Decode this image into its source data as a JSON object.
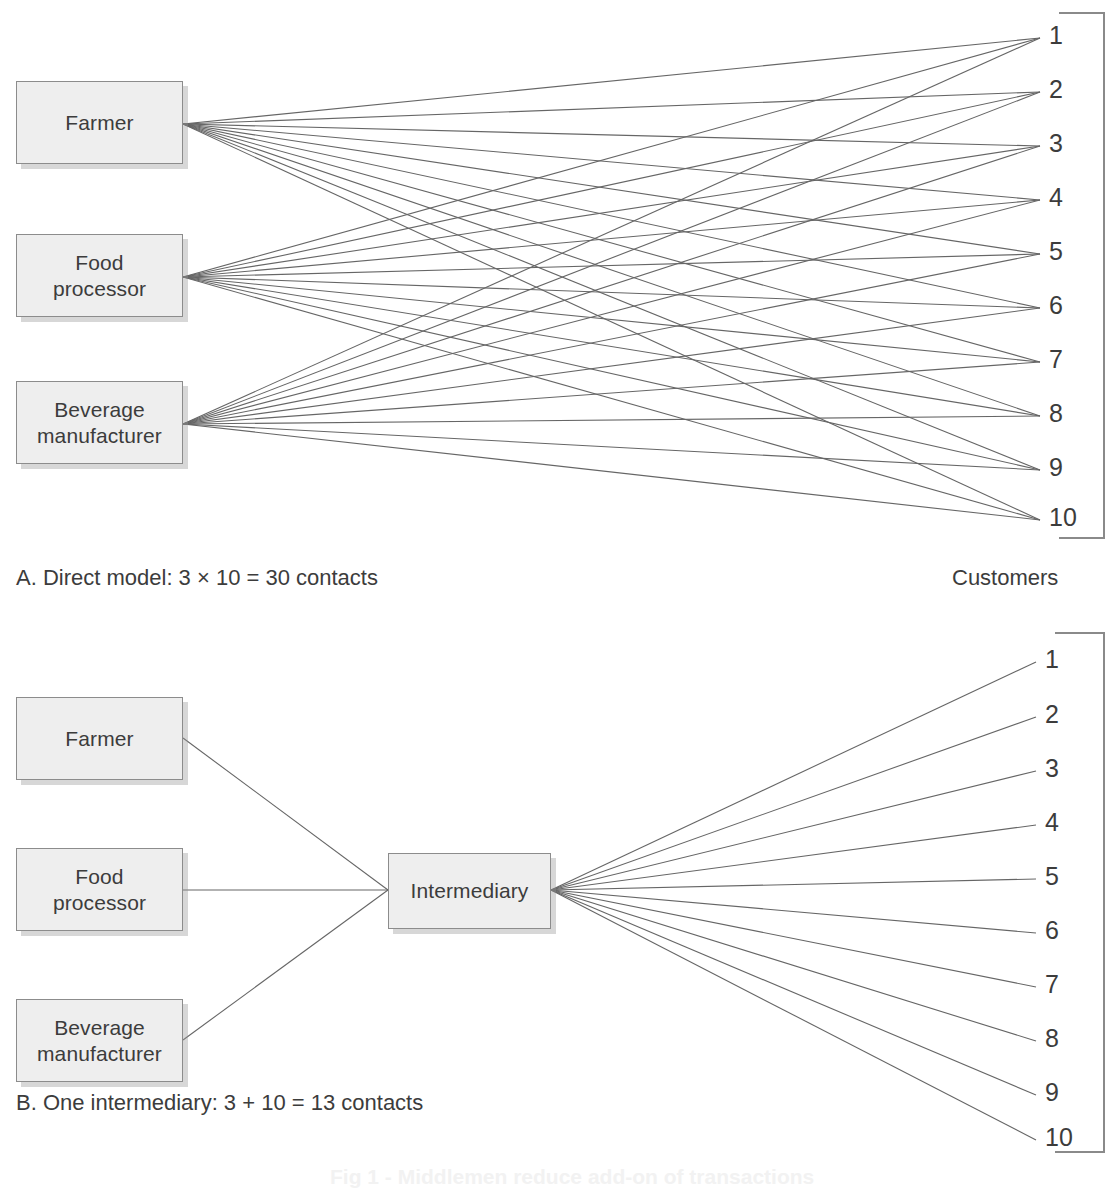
{
  "figure": {
    "title_partial": "Fig 1 - Middlemen reduce add-on of transactions"
  },
  "panel_a": {
    "caption": "A. Direct model: 3 × 10 = 30 contacts",
    "customers_label": "Customers",
    "producers": [
      {
        "id": "farmer",
        "lines": [
          "Farmer"
        ]
      },
      {
        "id": "food-processor",
        "lines": [
          "Food",
          "processor"
        ]
      },
      {
        "id": "beverage-manufacturer",
        "lines": [
          "Beverage",
          "manufacturer"
        ]
      }
    ],
    "customers": [
      "1",
      "2",
      "3",
      "4",
      "5",
      "6",
      "7",
      "8",
      "9",
      "10"
    ],
    "contacts_count": 30,
    "producer_count": 3,
    "customer_count": 10
  },
  "panel_b": {
    "caption": "B. One intermediary: 3 + 10 = 13 contacts",
    "producers": [
      {
        "id": "farmer",
        "lines": [
          "Farmer"
        ]
      },
      {
        "id": "food-processor",
        "lines": [
          "Food",
          "processor"
        ]
      },
      {
        "id": "beverage-manufacturer",
        "lines": [
          "Beverage",
          "manufacturer"
        ]
      }
    ],
    "intermediary": {
      "id": "intermediary",
      "lines": [
        "Intermediary"
      ]
    },
    "customers": [
      "1",
      "2",
      "3",
      "4",
      "5",
      "6",
      "7",
      "8",
      "9",
      "10"
    ],
    "contacts_count": 13,
    "producer_count": 3,
    "customer_count": 10
  },
  "colors": {
    "box_fill": "#eeeeee",
    "box_border": "#8c8c8c",
    "line": "#666666",
    "text": "#3c3c3c",
    "bracket": "#8a8a8a",
    "background": "#ffffff"
  },
  "geometry": {
    "panel_a": {
      "producer_anchors": [
        [
          183,
          124
        ],
        [
          183,
          277
        ],
        [
          183,
          424
        ]
      ],
      "customer_anchors": [
        [
          1040,
          38
        ],
        [
          1040,
          92
        ],
        [
          1040,
          146
        ],
        [
          1040,
          200
        ],
        [
          1040,
          254
        ],
        [
          1040,
          308
        ],
        [
          1040,
          362
        ],
        [
          1040,
          416
        ],
        [
          1040,
          470
        ],
        [
          1040,
          520
        ]
      ],
      "bracket": {
        "x_left": 1059,
        "x_right": 1104,
        "y_top": 13,
        "y_bottom": 538
      }
    },
    "panel_b": {
      "producer_anchors": [
        [
          183,
          738
        ],
        [
          183,
          890
        ],
        [
          183,
          1040
        ]
      ],
      "intermediary_in": [
        388,
        890
      ],
      "intermediary_out": [
        551,
        890
      ],
      "customer_anchors": [
        [
          1036,
          662
        ],
        [
          1036,
          717
        ],
        [
          1036,
          771
        ],
        [
          1036,
          825
        ],
        [
          1036,
          879
        ],
        [
          1036,
          933
        ],
        [
          1036,
          987
        ],
        [
          1036,
          1041
        ],
        [
          1036,
          1095
        ],
        [
          1036,
          1140
        ]
      ],
      "bracket": {
        "x_left": 1055,
        "x_right": 1104,
        "y_top": 633,
        "y_bottom": 1152
      }
    }
  }
}
